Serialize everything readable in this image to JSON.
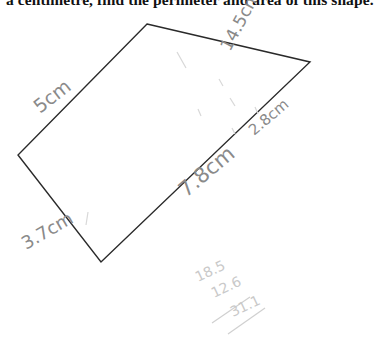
{
  "question": {
    "text": "a centimetre, find the perimeter and area of this shape."
  },
  "shape": {
    "type": "quadrilateral",
    "stroke_color": "#2a2a2a",
    "vertices": {
      "top": [
        147,
        24
      ],
      "right": [
        310,
        62
      ],
      "bottom": [
        101,
        262
      ],
      "left": [
        18,
        155
      ]
    }
  },
  "handwritten_labels": {
    "top_left_side": "5cm",
    "top_right_side": "14.5cm",
    "bottom_left_side": "3.7cm",
    "bottom_right_side": "7.8cm",
    "bottom_right_side_extra": "2.8cm",
    "pencil_color": "#8a8a8a"
  },
  "working": {
    "line1": "18.5",
    "line2": "12.6",
    "line3": "31.1",
    "faint_color": "#c9c9c9"
  }
}
